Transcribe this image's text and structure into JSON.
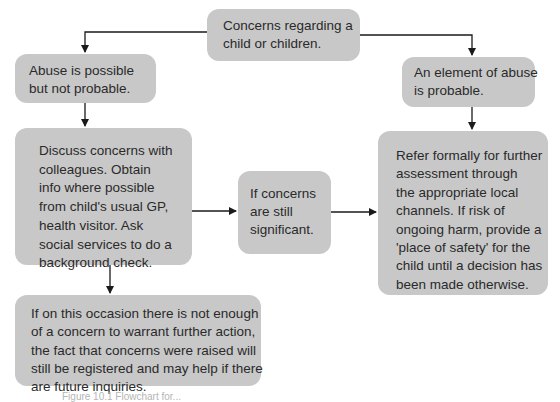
{
  "diagram": {
    "type": "flowchart",
    "nodes": {
      "start": {
        "lines": [
          "Concerns regarding a",
          "child or children."
        ]
      },
      "possible": {
        "lines": [
          "Abuse is possible",
          "but not probable."
        ]
      },
      "probable": {
        "lines": [
          "An element of abuse",
          "is probable."
        ]
      },
      "discuss": {
        "lines": [
          "Discuss concerns with",
          "colleagues. Obtain",
          "info where possible",
          "from child's usual GP,",
          "health visitor. Ask",
          "social services to do a",
          "background check."
        ]
      },
      "still_significant": {
        "lines": [
          "If concerns",
          "are still",
          "significant."
        ]
      },
      "refer": {
        "lines": [
          "Refer formally for further",
          "assessment through",
          "the appropriate local",
          "channels. If risk of",
          "ongoing harm, provide a",
          "'place of safety' for the",
          "child until a decision has",
          "been made otherwise."
        ]
      },
      "not_enough": {
        "lines": [
          "If on this occasion there is not enough",
          "of a concern to warrant further action,",
          "the fact that concerns were raised will",
          "still be registered and may help if there",
          "are future inquiries."
        ]
      }
    },
    "edges": [
      [
        "start",
        "possible"
      ],
      [
        "start",
        "probable"
      ],
      [
        "possible",
        "discuss"
      ],
      [
        "probable",
        "refer"
      ],
      [
        "discuss",
        "still_significant"
      ],
      [
        "still_significant",
        "refer"
      ],
      [
        "discuss",
        "not_enough"
      ]
    ],
    "caption": "Figure 10.1 Flowchart for..."
  },
  "colors": {
    "box_fill": "#c8c8c8",
    "line": "#1a1a1a",
    "text": "#2a2a2a"
  }
}
